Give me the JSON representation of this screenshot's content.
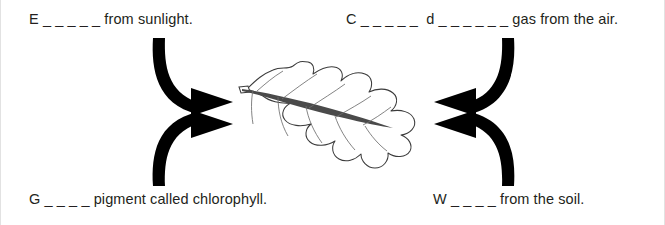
{
  "diagram": {
    "center_subject": "leaf",
    "ink_color": "#231f20",
    "background_color": "#ffffff",
    "labels": {
      "top_left": "E _ _ _ _ _ from sunlight.",
      "top_right": "C _ _ _ _ _  d _ _ _ _ _ _ gas from the air.",
      "bottom_left": "G _ _ _ _ pigment called chlorophyll.",
      "bottom_right": "W _ _ _ _ from the soil."
    },
    "arrows": [
      {
        "name": "arrow-top-left",
        "direction": "curves down then points right toward leaf"
      },
      {
        "name": "arrow-top-right",
        "direction": "curves down then points left toward leaf"
      },
      {
        "name": "arrow-bottom-left",
        "direction": "curves up then points right toward leaf"
      },
      {
        "name": "arrow-bottom-right",
        "direction": "curves up then points left toward leaf"
      }
    ]
  }
}
